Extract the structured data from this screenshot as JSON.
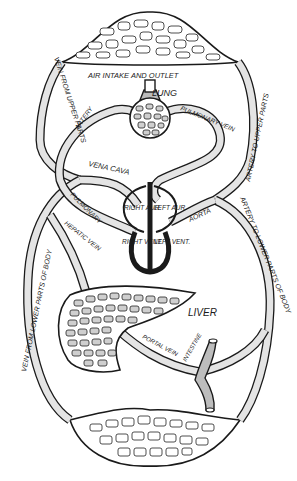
{
  "diagram": {
    "type": "circulatory-system-schematic",
    "labels": {
      "air_intake": "AIR INTAKE AND OUTLET",
      "lung": "LUNG",
      "pulmonary_artery_top": "ARTERY",
      "pulmonary_vein": "PULMONARY VEIN",
      "vena_cava": "VENA CAVA",
      "pulmonary_artery": "PULMONARY",
      "right_aur": "RIGHT AUR.",
      "left_aur": "LEFT AUR.",
      "right_vent": "RIGHT VENT.",
      "left_vent": "LEFT VENT.",
      "aorta": "AORTA",
      "hepatic_vein": "HEPATIC VEIN",
      "liver": "LIVER",
      "portal_vein": "PORTAL VEIN",
      "intestine": "INTESTINE",
      "vein_upper": "VEIN FROM UPPER PARTS",
      "artery_upper": "ARTERY TO UPPER PARTS",
      "vein_lower": "VEIN FROM LOWER PARTS OF BODY",
      "artery_lower": "ARTERY TO LOWER PARTS OF BODY"
    },
    "colors": {
      "ink": "#1a1a1a",
      "vessel_fill": "#e4e4e4",
      "tissue_fill": "#cfcfcf",
      "background": "#ffffff"
    }
  }
}
